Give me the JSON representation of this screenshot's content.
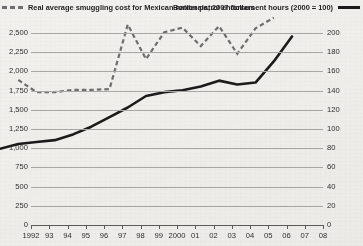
{
  "legend": {
    "left": {
      "label": "Real average smuggling cost for Mexican nationals, 2007 dollars",
      "line_style": "dashed",
      "color": "#6f6f6f",
      "swatch_name": "dashed-line-swatch"
    },
    "right": {
      "label": "Border patrol enforcement hours (2000 = 100)",
      "line_style": "solid",
      "color": "#1b1b1b",
      "swatch_name": "solid-line-swatch"
    }
  },
  "chart_data": {
    "type": "line",
    "title": "",
    "subtitle": "",
    "xlabel": "",
    "ylabel": "",
    "grid": true,
    "legend_position": "top",
    "x": [
      "1992",
      "93",
      "94",
      "95",
      "96",
      "97",
      "98",
      "99",
      "2000",
      "01",
      "02",
      "03",
      "04",
      "05",
      "06",
      "07",
      "08"
    ],
    "x_tick_labels": [
      "1992",
      "93",
      "94",
      "95",
      "96",
      "97",
      "98",
      "99",
      "2000",
      "01",
      "02",
      "03",
      "04",
      "05",
      "06",
      "07",
      "08"
    ],
    "axes": [
      {
        "id": "left",
        "name": "Real average smuggling cost (2007 dollars)",
        "ylim": [
          0,
          2500
        ],
        "ticks": [
          0,
          250,
          500,
          750,
          1000,
          1250,
          1500,
          1750,
          2000,
          2250,
          2500
        ],
        "tick_labels": [
          "0",
          "250",
          "750",
          "750",
          "1,000",
          "1,250",
          "1,500",
          "1,750",
          "2,000",
          "2,250",
          "2,500"
        ]
      },
      {
        "id": "right",
        "name": "Border patrol enforcement hours index (2000 = 100)",
        "ylim": [
          0,
          200
        ],
        "ticks": [
          0,
          20,
          40,
          60,
          80,
          100,
          120,
          140,
          160,
          180,
          200
        ],
        "tick_labels": [
          "0",
          "20",
          "40",
          "60",
          "80",
          "100",
          "120",
          "140",
          "160",
          "180",
          "200"
        ]
      }
    ],
    "left_tick_labels": [
      "2,500",
      "2,250",
      "2,000",
      "1,750",
      "1,500",
      "1,250",
      "1,000",
      "750",
      "500",
      "250",
      "0"
    ],
    "right_tick_labels": [
      "200",
      "180",
      "160",
      "140",
      "120",
      "100",
      "80",
      "60",
      "40",
      "20",
      "0"
    ],
    "series": [
      {
        "name": "Real average smuggling cost for Mexican nationals, 2007 dollars",
        "axis": "left",
        "style": "dashed",
        "color": "#6f6f6f",
        "x": [
          "93",
          "94",
          "95",
          "96",
          "97",
          "98",
          "99",
          "2000",
          "01",
          "02",
          "03",
          "04",
          "05",
          "06",
          "07"
        ],
        "values": [
          1460,
          1300,
          1300,
          1330,
          1330,
          1340,
          2180,
          1730,
          2080,
          2140,
          1900,
          2160,
          1800,
          2130,
          2270
        ]
      },
      {
        "name": "Border patrol enforcement hours (2000 = 100)",
        "axis": "right",
        "style": "solid",
        "color": "#1b1b1b",
        "x": [
          "1992",
          "93",
          "94",
          "95",
          "96",
          "97",
          "98",
          "99",
          "2000",
          "01",
          "02",
          "03",
          "04",
          "05",
          "06",
          "07",
          "08"
        ],
        "values": [
          45,
          50,
          52,
          54,
          60,
          68,
          78,
          88,
          100,
          104,
          106,
          110,
          116,
          112,
          114,
          136,
          162
        ]
      }
    ]
  }
}
